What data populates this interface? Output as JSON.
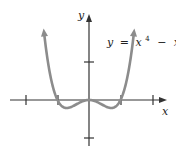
{
  "equation": {
    "y": "y",
    "eq": "=",
    "x1": "x",
    "exp1": "4",
    "minus": "−",
    "x2": "x",
    "exp2": "2"
  },
  "axes": {
    "x_label": "x",
    "y_label": "y"
  },
  "colors": {
    "axis": "#333333",
    "curve": "#8c8c8c"
  },
  "chart_data": {
    "type": "line",
    "xlabel": "x",
    "ylabel": "y",
    "x_ticks": [
      -2,
      -1,
      1,
      2
    ],
    "y_ticks": [
      -1,
      1
    ],
    "tick_labels_shown": false,
    "function": "x^4 - x^2",
    "x_range": [
      -1.5,
      1.5
    ],
    "key_points": [
      [
        -1,
        0
      ],
      [
        -0.707,
        -0.25
      ],
      [
        0,
        0
      ],
      [
        0.707,
        -0.25
      ],
      [
        1,
        0
      ]
    ],
    "grid": false
  }
}
